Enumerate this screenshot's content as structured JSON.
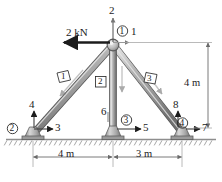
{
  "figure": {
    "load": {
      "label": "2 kN",
      "direction": "left",
      "magnitude": 2,
      "unit": "kN"
    },
    "colors": {
      "member_fill": "#a9a9a9",
      "member_edge": "#4a4a4a",
      "member_highlight": "#d8d8d8",
      "ground": "#9a9a9a",
      "dimension_line": "#9a9a9a",
      "arrow": "#1c1c1c",
      "dof_arrow": "#6e6e6e",
      "text": "#1c1c1c"
    },
    "nodes": [
      {
        "id": "1",
        "label": "1",
        "marker": "circled",
        "x": 112,
        "y": 44,
        "name": "apex-joint"
      },
      {
        "id": "2",
        "label": "2",
        "marker": "circled",
        "x": 25,
        "y": 129,
        "name": "left-support-joint"
      },
      {
        "id": "3",
        "label": "3",
        "marker": "circled",
        "x": 123,
        "y": 124,
        "name": "center-support-joint"
      },
      {
        "id": "4",
        "label": "4",
        "marker": "circled",
        "x": 180,
        "y": 124,
        "name": "right-support-joint"
      }
    ],
    "members": [
      {
        "id": "1",
        "label": "1",
        "marker": "boxed",
        "from": "2",
        "to": "1",
        "x": 57,
        "y": 80,
        "name": "member-1-left-diagonal"
      },
      {
        "id": "2",
        "label": "2",
        "marker": "boxed",
        "from": "3",
        "to": "1",
        "x": 99,
        "y": 85,
        "name": "member-2-vertical"
      },
      {
        "id": "3",
        "label": "3",
        "marker": "boxed",
        "from": "4",
        "to": "1",
        "x": 148,
        "y": 81,
        "name": "member-3-right-diagonal"
      }
    ],
    "dof_labels": [
      {
        "label": "2",
        "x": 110,
        "y": 6,
        "axis": "vertical",
        "name": "dof-2-apex-vertical"
      },
      {
        "label": "1",
        "x": 132,
        "y": 30,
        "axis": "horizontal",
        "name": "dof-1-apex-horizontal"
      },
      {
        "label": "4",
        "x": 27,
        "y": 103,
        "axis": "vertical",
        "name": "dof-4-left-vertical"
      },
      {
        "label": "3",
        "x": 52,
        "y": 124,
        "axis": "horizontal",
        "name": "dof-3-left-horizontal"
      },
      {
        "label": "6",
        "x": 101,
        "y": 110,
        "axis": "vertical",
        "name": "dof-6-center-vertical"
      },
      {
        "label": "5",
        "x": 148,
        "y": 124,
        "axis": "horizontal",
        "name": "dof-5-center-horizontal"
      },
      {
        "label": "8",
        "x": 171,
        "y": 103,
        "axis": "vertical",
        "name": "dof-8-right-vertical"
      },
      {
        "label": "7",
        "x": 205,
        "y": 124,
        "axis": "horizontal",
        "name": "dof-7-right-horizontal"
      }
    ],
    "dimensions": [
      {
        "label": "4 m",
        "x": 178,
        "y": 76,
        "orientation": "vertical",
        "name": "dimension-height-4m"
      },
      {
        "label": "4 m",
        "x": 56,
        "y": 157,
        "orientation": "horizontal",
        "name": "dimension-left-span-4m"
      },
      {
        "label": "3 m",
        "x": 143,
        "y": 157,
        "orientation": "horizontal",
        "name": "dimension-right-span-3m"
      }
    ]
  }
}
